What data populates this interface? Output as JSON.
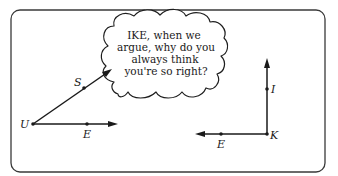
{
  "speech_bubble": {
    "speaker_angle": "SUE",
    "addressee_angle": "IKE",
    "lines": [
      "IKE, when we",
      "argue, why do you",
      "always think",
      "you're so right?"
    ]
  },
  "left_angle": {
    "vertex_label": "U",
    "upper_ray_point_label": "S",
    "lower_ray_point_label": "E",
    "type": "acute"
  },
  "right_angle": {
    "vertex_label": "K",
    "vertical_ray_point_label": "I",
    "horizontal_ray_point_label": "E",
    "type": "right"
  },
  "colors": {
    "ink": "#1a1a1a",
    "frame": "#3a3a3a",
    "background": "#ffffff"
  }
}
